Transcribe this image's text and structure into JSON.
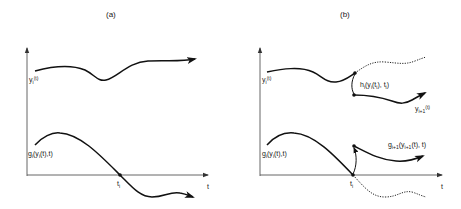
{
  "panels": {
    "a": {
      "title": "(a)",
      "top_curve_label": {
        "base": "y",
        "sub": "i",
        "arg": "(t)"
      },
      "bottom_curve_label": {
        "base": "g",
        "sub": "i",
        "arg": "(y",
        "sub2": "i",
        "arg2": "(t),t)"
      },
      "crossing_label": {
        "base": "t",
        "sub": "i"
      },
      "x_axis_label": "t"
    },
    "b": {
      "title": "(b)",
      "top_curve_label": {
        "base": "y",
        "sub": "i",
        "arg": "(t)"
      },
      "bottom_curve_label": {
        "base": "g",
        "sub": "i",
        "arg": "(y",
        "sub2": "i",
        "arg2": "(t),t)"
      },
      "jump_label": {
        "base": "h",
        "sub": "i",
        "arg": "(y",
        "sub2": "i",
        "arg2": "(t",
        "sub3": "i",
        "arg3": "), t",
        "sub4": "i",
        "arg4": ")"
      },
      "new_top_label": {
        "base": "y",
        "sub": "i+1",
        "arg": "(t)"
      },
      "new_bottom_label": {
        "base": "g",
        "sub": "i+1",
        "arg": "(y",
        "sub2": "i+1",
        "arg2": "(t), t)"
      },
      "crossing_label": {
        "base": "t",
        "sub": "i"
      },
      "x_axis_label": "t"
    }
  },
  "colors": {
    "line": "#1a1a1a",
    "background": "#ffffff"
  }
}
